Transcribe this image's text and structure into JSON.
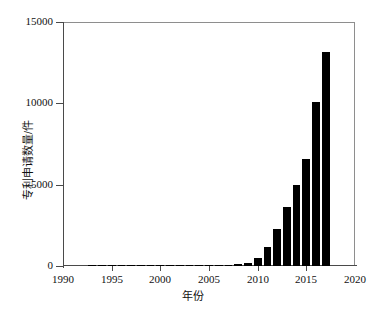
{
  "chart_data": {
    "type": "bar",
    "title": "",
    "xlabel": "年份",
    "ylabel": "专利申请数量/件",
    "xlim": [
      1990,
      2020
    ],
    "ylim": [
      0,
      15000
    ],
    "grid": false,
    "legend": "none",
    "x_ticks": [
      "1990",
      "1995",
      "2000",
      "2005",
      "2010",
      "2015",
      "2020"
    ],
    "x_tick_values": [
      1990,
      1995,
      2000,
      2005,
      2010,
      2015,
      2020
    ],
    "y_ticks": [
      "0",
      "5000",
      "10000",
      "15000"
    ],
    "y_tick_values": [
      0,
      5000,
      10000,
      15000
    ],
    "categories": [
      1993,
      1994,
      1995,
      1996,
      1997,
      1998,
      1999,
      2000,
      2001,
      2002,
      2003,
      2004,
      2005,
      2006,
      2007,
      2008,
      2009,
      2010,
      2011,
      2012,
      2013,
      2014,
      2015,
      2016,
      2017
    ],
    "values": [
      20,
      60,
      90,
      25,
      20,
      20,
      25,
      70,
      45,
      35,
      40,
      45,
      50,
      60,
      70,
      110,
      200,
      500,
      1150,
      2300,
      3600,
      5000,
      6600,
      10100,
      13150
    ],
    "bar_color": "#000000",
    "axis_color": "#4a4a4a",
    "background_color": "#ffffff"
  },
  "axis_titles": {
    "x": "年份",
    "y": "专利申请数量/件"
  }
}
